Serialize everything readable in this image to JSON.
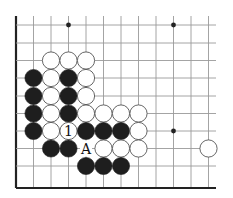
{
  "diagram": {
    "grid": {
      "columns_x": [
        16,
        33.5,
        51,
        68.5,
        86,
        103.5,
        121,
        138.5,
        156,
        173.5,
        191,
        208.5
      ],
      "rows_y": [
        25,
        43,
        60.5,
        78,
        96,
        113.5,
        131,
        148.5,
        166,
        188
      ],
      "line_extent": {
        "top": 16,
        "right": 216
      },
      "edges": [
        "left",
        "bottom"
      ],
      "line_color": "#9a9a9a",
      "edge_color": "#222222"
    },
    "star_points": [
      {
        "col": 3,
        "row": 0
      },
      {
        "col": 9,
        "row": 0
      },
      {
        "col": 9,
        "row": 6
      }
    ],
    "stones": [
      {
        "color": "white",
        "col": 2,
        "row": 2
      },
      {
        "color": "white",
        "col": 3,
        "row": 2
      },
      {
        "color": "white",
        "col": 4,
        "row": 2
      },
      {
        "color": "black",
        "col": 1,
        "row": 3
      },
      {
        "color": "white",
        "col": 2,
        "row": 3
      },
      {
        "color": "black",
        "col": 3,
        "row": 3
      },
      {
        "color": "white",
        "col": 4,
        "row": 3
      },
      {
        "color": "black",
        "col": 1,
        "row": 4
      },
      {
        "color": "white",
        "col": 2,
        "row": 4
      },
      {
        "color": "black",
        "col": 3,
        "row": 4
      },
      {
        "color": "white",
        "col": 4,
        "row": 4
      },
      {
        "color": "black",
        "col": 1,
        "row": 5
      },
      {
        "color": "white",
        "col": 2,
        "row": 5
      },
      {
        "color": "black",
        "col": 3,
        "row": 5
      },
      {
        "color": "white",
        "col": 4,
        "row": 5
      },
      {
        "color": "white",
        "col": 5,
        "row": 5
      },
      {
        "color": "white",
        "col": 6,
        "row": 5
      },
      {
        "color": "white",
        "col": 7,
        "row": 5
      },
      {
        "color": "black",
        "col": 1,
        "row": 6
      },
      {
        "color": "white",
        "col": 2,
        "row": 6
      },
      {
        "color": "white",
        "col": 3,
        "row": 6,
        "label": "1"
      },
      {
        "color": "black",
        "col": 4,
        "row": 6
      },
      {
        "color": "black",
        "col": 5,
        "row": 6
      },
      {
        "color": "black",
        "col": 6,
        "row": 6
      },
      {
        "color": "white",
        "col": 7,
        "row": 6
      },
      {
        "color": "black",
        "col": 2,
        "row": 7
      },
      {
        "color": "black",
        "col": 3,
        "row": 7
      },
      {
        "color": "white",
        "col": 5,
        "row": 7
      },
      {
        "color": "white",
        "col": 6,
        "row": 7
      },
      {
        "color": "white",
        "col": 7,
        "row": 7
      },
      {
        "color": "white",
        "col": 11,
        "row": 7
      },
      {
        "color": "black",
        "col": 4,
        "row": 8
      },
      {
        "color": "black",
        "col": 5,
        "row": 8
      },
      {
        "color": "black",
        "col": 6,
        "row": 8
      }
    ],
    "point_labels": [
      {
        "text": "A",
        "col": 4,
        "row": 7
      }
    ],
    "stone_radius": 8.6,
    "colors": {
      "black": "#1e1e1e",
      "white": "#ffffff",
      "white_outline": "#555555",
      "star": "#222222"
    }
  }
}
